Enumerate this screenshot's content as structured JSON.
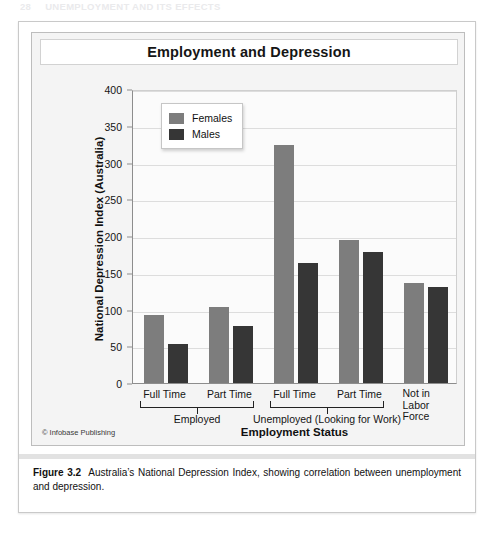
{
  "running_head": {
    "number": "28",
    "text": "UNEMPLOYMENT AND ITS EFFECTS"
  },
  "chart": {
    "title": "Employment and Depression",
    "y_axis_title": "National Depression Index (Australia)",
    "x_axis_title": "Employment Status",
    "y_ticks": [
      "0",
      "50",
      "100",
      "150",
      "200",
      "250",
      "300",
      "350",
      "400"
    ],
    "legend": {
      "female_label": "Females",
      "male_label": "Males",
      "female_color": "#7d7d7d",
      "male_color": "#363636"
    },
    "credit": "© Infobase Publishing"
  },
  "chart_data": {
    "type": "bar",
    "title": "Employment and Depression",
    "xlabel": "Employment Status",
    "ylabel": "National Depression Index (Australia)",
    "ylim": [
      0,
      400
    ],
    "ytick_step": 50,
    "grid": true,
    "legend_position": "top-left inside plot",
    "categories": [
      "Full Time",
      "Part Time",
      "Full Time",
      "Part Time",
      "Not in Labor Force"
    ],
    "groups": [
      {
        "label": "Employed",
        "categories": [
          "Full Time",
          "Part Time"
        ]
      },
      {
        "label": "Unemployed (Looking for Work)",
        "categories": [
          "Full Time",
          "Part Time"
        ]
      },
      {
        "label": "Not in Labor Force",
        "categories": []
      }
    ],
    "series": [
      {
        "name": "Females",
        "color": "#7d7d7d",
        "values": [
          93,
          103,
          324,
          195,
          136
        ]
      },
      {
        "name": "Males",
        "color": "#363636",
        "values": [
          53,
          77,
          163,
          178,
          131
        ]
      }
    ]
  },
  "caption": {
    "label": "Figure 3.2",
    "text": "Australia’s National Depression Index, showing correlation between unemployment and depression."
  },
  "axis_labels": {
    "t0": "Full Time",
    "t1": "Part Time",
    "t2": "Full Time",
    "t3": "Part Time",
    "t4_line1": "Not in",
    "t4_line2": "Labor",
    "t4_line3": "Force",
    "g0": "Employed",
    "g1": "Unemployed (Looking for Work)"
  }
}
